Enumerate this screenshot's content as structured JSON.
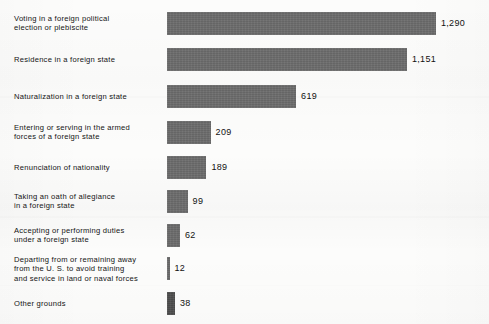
{
  "chart_data": {
    "type": "bar",
    "orientation": "horizontal",
    "title": "",
    "subtitle": "",
    "xlabel": "",
    "ylabel": "",
    "grid": false,
    "legend": null,
    "axis_visible": false,
    "tick_labels": [],
    "value_label_position": "outside-end",
    "xlim": [
      0,
      1290
    ],
    "bar_color": "#6b6b6b",
    "last_bar_color": "#4d4d4d",
    "background_color": "#fcfcfb",
    "text_color": "#141414",
    "categories": [
      "Voting in a foreign political\nelection or plebiscite",
      "Residence in a foreign state",
      "Naturalization in a foreign state",
      "Entering or serving in the armed\nforces of a foreign state",
      "Renunciation of nationality",
      "Taking an oath of allegiance\nin a foreign state",
      "Accepting or performing duties\nunder a foreign state",
      "Departing from or remaining away\nfrom the U. S. to avoid training\nand service in land or naval forces",
      "Other grounds"
    ],
    "values": [
      1290,
      1151,
      619,
      209,
      189,
      99,
      62,
      12,
      38
    ],
    "value_labels": [
      "1,290",
      "1,151",
      "619",
      "209",
      "189",
      "99",
      "62",
      "12",
      "38"
    ]
  },
  "bars": [
    {
      "label": "Voting in a foreign political\nelection or plebiscite",
      "value_label": "1,290",
      "value": 1290
    },
    {
      "label": "Residence in a foreign state",
      "value_label": "1,151",
      "value": 1151
    },
    {
      "label": "Naturalization in a foreign state",
      "value_label": "619",
      "value": 619
    },
    {
      "label": "Entering or serving in the armed\nforces of a foreign state",
      "value_label": "209",
      "value": 209
    },
    {
      "label": "Renunciation of nationality",
      "value_label": "189",
      "value": 189
    },
    {
      "label": "Taking an oath of allegiance\nin a foreign state",
      "value_label": "99",
      "value": 99
    },
    {
      "label": "Accepting or performing duties\nunder a foreign state",
      "value_label": "62",
      "value": 62
    },
    {
      "label": "Departing from or remaining away\nfrom the U. S. to avoid training\nand service in land or naval forces",
      "value_label": "12",
      "value": 12
    },
    {
      "label": "Other grounds",
      "value_label": "38",
      "value": 38
    }
  ]
}
